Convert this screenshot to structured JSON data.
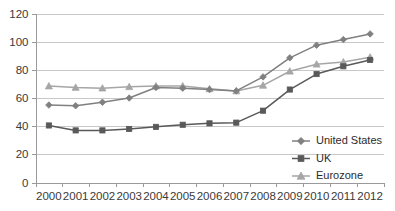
{
  "chart_data": {
    "type": "line",
    "title": "",
    "xlabel": "",
    "ylabel": "",
    "categories": [
      "2000",
      "2001",
      "2002",
      "2003",
      "2004",
      "2005",
      "2006",
      "2007",
      "2008",
      "2009",
      "2010",
      "2011",
      "2012"
    ],
    "ylim": [
      0,
      120
    ],
    "yticks": [
      0,
      20,
      40,
      60,
      80,
      100,
      120
    ],
    "ytick_labels": [
      "0",
      "20",
      "40",
      "60",
      "80",
      "100",
      "120"
    ],
    "grid": true,
    "legend_position": "bottom-right",
    "series": [
      {
        "name": "United States",
        "marker": "diamond",
        "color": "#808080",
        "values": [
          55,
          54.5,
          57,
          60,
          67.5,
          67,
          66,
          65,
          75,
          88.5,
          97.5,
          101.5,
          105.5
        ]
      },
      {
        "name": "UK",
        "marker": "square",
        "color": "#595959",
        "values": [
          40.5,
          37,
          37,
          38,
          39.5,
          41,
          42,
          42.5,
          51,
          66,
          77,
          82.5,
          87
        ]
      },
      {
        "name": "Eurozone",
        "marker": "triangle",
        "color": "#a6a6a6",
        "values": [
          68.5,
          67.5,
          67,
          68,
          68.5,
          68.5,
          66.5,
          65,
          69,
          79,
          84,
          85.5,
          89
        ]
      }
    ]
  },
  "colors": {
    "grid": "#c8c8c8",
    "axis": "#9a9a9a",
    "text": "#2b2b2b",
    "background": "#ffffff"
  }
}
